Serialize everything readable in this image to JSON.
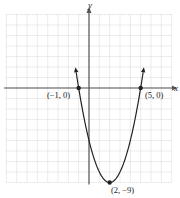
{
  "chart_data": {
    "type": "line",
    "title": "",
    "xlabel": "x",
    "ylabel": "y",
    "xlim": [
      -8,
      8
    ],
    "ylim": [
      -9,
      7
    ],
    "grid": true,
    "function": "y = (x - 2)^2 - 9",
    "series": [
      {
        "name": "parabola",
        "x": [
          -1.24,
          -1,
          0,
          1,
          2,
          3,
          4,
          5,
          5.24
        ],
        "values": [
          1.5,
          0,
          -5,
          -8,
          -9,
          -8,
          -5,
          0,
          1.5
        ]
      }
    ],
    "points": [
      {
        "x": -1,
        "y": 0,
        "label": "(−1, 0)"
      },
      {
        "x": 5,
        "y": 0,
        "label": "(5, 0)"
      },
      {
        "x": 2,
        "y": -9,
        "label": "(2, −9)"
      }
    ]
  },
  "colors": {
    "grid": "#c8c8c8",
    "axis": "#555555",
    "curve": "#222222"
  }
}
